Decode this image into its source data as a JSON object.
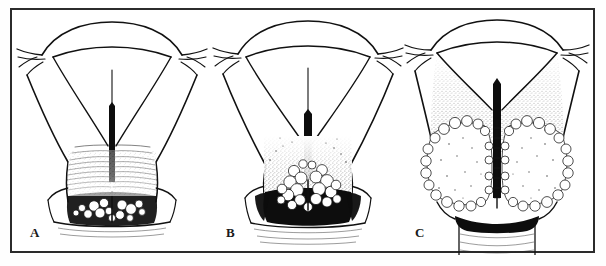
{
  "figure": {
    "title": "",
    "background_color": "#ffffff",
    "ink_color": "#111111",
    "frame": {
      "border_color": "#2b2b2b",
      "border_width_px": 2
    },
    "panel_count": 3
  },
  "panels": [
    {
      "label": "A",
      "name": "panel-a",
      "subject": "uterus-with-cervix-early-lesion",
      "description": "Uterus seen from front with fallopian tubes, body, cervix showing endocervical canal rugae and a small nodular tumor at the external os",
      "tumor_extent": "small",
      "stipple_upper_y": 165
    },
    {
      "label": "B",
      "name": "panel-b",
      "subject": "uterus-with-cervix-intermediate-lesion",
      "description": "Uterus with a larger nodular tumor mass filling the cervix and dense dark infiltration of the cervical stroma",
      "tumor_extent": "moderate",
      "stipple_upper_y": 130
    },
    {
      "label": "C",
      "name": "panel-c",
      "subject": "uterus-with-cervix-advanced-bulky-lesion",
      "description": "Uterus with a large bilateral bulky exophytic cauliflower-like tumor replacing the cervix and extending into the uterine body and upper vagina",
      "tumor_extent": "large",
      "stipple_upper_y": 60
    }
  ],
  "labels": {
    "a": "A",
    "b": "B",
    "c": "C"
  }
}
